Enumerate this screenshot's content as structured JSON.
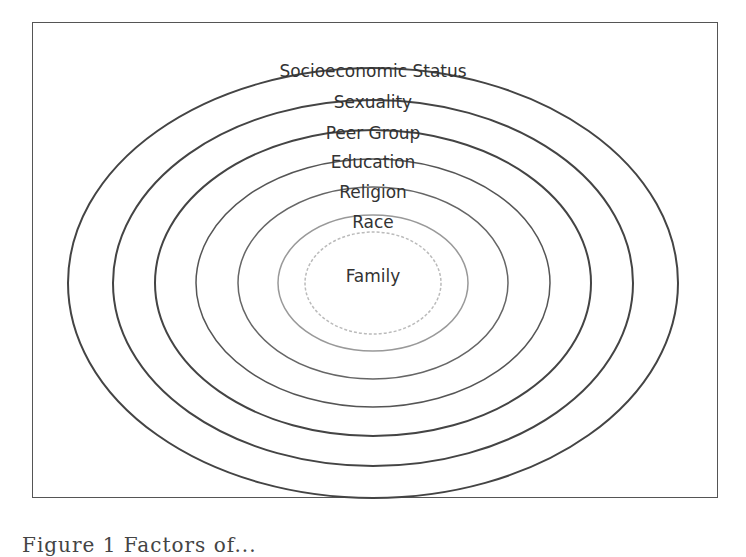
{
  "diagram": {
    "type": "concentric-ellipses",
    "center": {
      "x": 373,
      "y": 283
    },
    "stroke_color": "#444444",
    "rings": [
      {
        "label": "Socioeconomic Status",
        "rx": 305,
        "ry": 215,
        "label_y": 77,
        "stroke": "#444444",
        "dash": ""
      },
      {
        "label": "Sexuality",
        "rx": 260,
        "ry": 183,
        "label_y": 108,
        "stroke": "#444444",
        "dash": ""
      },
      {
        "label": "Peer Group",
        "rx": 218,
        "ry": 153,
        "label_y": 139,
        "stroke": "#444444",
        "dash": ""
      },
      {
        "label": "Education",
        "rx": 177,
        "ry": 124,
        "label_y": 168,
        "stroke": "#555555",
        "dash": ""
      },
      {
        "label": "Religion",
        "rx": 135,
        "ry": 96,
        "label_y": 198,
        "stroke": "#666666",
        "dash": ""
      },
      {
        "label": "Race",
        "rx": 95,
        "ry": 68,
        "label_y": 228,
        "stroke": "#999999",
        "dash": ""
      },
      {
        "label": "Family",
        "rx": 68,
        "ry": 51,
        "label_y": 282,
        "stroke": "#bbbbbb",
        "dash": "3 2"
      }
    ]
  },
  "caption": {
    "text": "Figure 1  Factors of...",
    "visible": "partially cropped"
  }
}
